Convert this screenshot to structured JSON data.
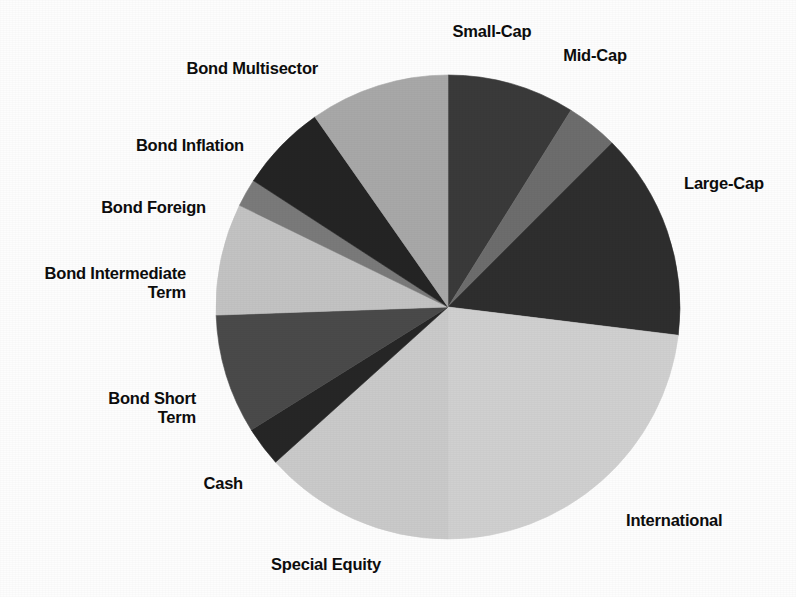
{
  "chart_data": {
    "type": "pie",
    "title": "",
    "subtitle": "",
    "xlabel": "",
    "ylabel": "",
    "legend_position": "none",
    "labels_position": "outside",
    "grid": false,
    "start_angle_deg": 0,
    "direction": "clockwise",
    "center": {
      "x": 448,
      "y": 307
    },
    "radius": 232,
    "categories": [
      "Small-Cap",
      "Mid-Cap",
      "Large-Cap",
      "International",
      "Special Equity",
      "Cash",
      "Bond Short Term",
      "Bond Intermediate Term",
      "Bond Foreign",
      "Bond Inflation",
      "Bond Multisector"
    ],
    "values": [
      8.9,
      3.6,
      14.4,
      23.1,
      13.3,
      2.8,
      8.3,
      7.8,
      1.9,
      6.1,
      9.8
    ],
    "unit": "percent",
    "slices": [
      {
        "label": "Small-Cap",
        "label_lines": [
          "Small-Cap"
        ],
        "value": 8.9,
        "start_deg": 0.0,
        "end_deg": 32.0,
        "color": "#3a3a3a"
      },
      {
        "label": "Mid-Cap",
        "label_lines": [
          "Mid-Cap"
        ],
        "value": 3.6,
        "start_deg": 32.0,
        "end_deg": 45.0,
        "color": "#6d6d6d"
      },
      {
        "label": "Large-Cap",
        "label_lines": [
          "Large-Cap"
        ],
        "value": 14.4,
        "start_deg": 45.0,
        "end_deg": 97.0,
        "color": "#2e2e2e"
      },
      {
        "label": "International",
        "label_lines": [
          "International"
        ],
        "value": 23.1,
        "start_deg": 97.0,
        "end_deg": 180.0,
        "color": "#d0d0d0"
      },
      {
        "label": "Special Equity",
        "label_lines": [
          "Special Equity"
        ],
        "value": 13.3,
        "start_deg": 180.0,
        "end_deg": 228.0,
        "color": "#cacaca"
      },
      {
        "label": "Cash",
        "label_lines": [
          "Cash"
        ],
        "value": 2.8,
        "start_deg": 228.0,
        "end_deg": 238.0,
        "color": "#262626"
      },
      {
        "label": "Bond Short Term",
        "label_lines": [
          "Bond Short",
          "Term"
        ],
        "value": 8.3,
        "start_deg": 238.0,
        "end_deg": 268.0,
        "color": "#4a4a4a"
      },
      {
        "label": "Bond Intermediate Term",
        "label_lines": [
          "Bond Intermediate",
          "Term"
        ],
        "value": 7.8,
        "start_deg": 268.0,
        "end_deg": 296.0,
        "color": "#c3c3c3"
      },
      {
        "label": "Bond Foreign",
        "label_lines": [
          "Bond Foreign"
        ],
        "value": 1.9,
        "start_deg": 296.0,
        "end_deg": 303.0,
        "color": "#7a7a7a"
      },
      {
        "label": "Bond Inflation",
        "label_lines": [
          "Bond Inflation"
        ],
        "value": 6.1,
        "start_deg": 303.0,
        "end_deg": 325.0,
        "color": "#242424"
      },
      {
        "label": "Bond Multisector",
        "label_lines": [
          "Bond Multisector"
        ],
        "value": 9.8,
        "start_deg": 325.0,
        "end_deg": 360.0,
        "color": "#a8a8a8"
      }
    ],
    "label_positions": [
      {
        "label": "Small-Cap",
        "x": 492,
        "y": 22,
        "align": "center"
      },
      {
        "label": "Mid-Cap",
        "x": 595,
        "y": 46,
        "align": "center"
      },
      {
        "label": "Large-Cap",
        "x": 684,
        "y": 174,
        "align": "left"
      },
      {
        "label": "International",
        "x": 626,
        "y": 511,
        "align": "left"
      },
      {
        "label": "Special Equity",
        "x": 381,
        "y": 555,
        "align": "right"
      },
      {
        "label": "Cash",
        "x": 243,
        "y": 474,
        "align": "right"
      },
      {
        "label": "Bond Short Term",
        "x": 196,
        "y": 389,
        "align": "right"
      },
      {
        "label": "Bond Intermediate Term",
        "x": 186,
        "y": 264,
        "align": "right"
      },
      {
        "label": "Bond Foreign",
        "x": 206,
        "y": 198,
        "align": "right"
      },
      {
        "label": "Bond Inflation",
        "x": 244,
        "y": 136,
        "align": "right"
      },
      {
        "label": "Bond Multisector",
        "x": 318,
        "y": 59,
        "align": "right"
      }
    ]
  },
  "page": {
    "background_color": "#fdfdfd",
    "text_color": "#0d0d0d"
  }
}
